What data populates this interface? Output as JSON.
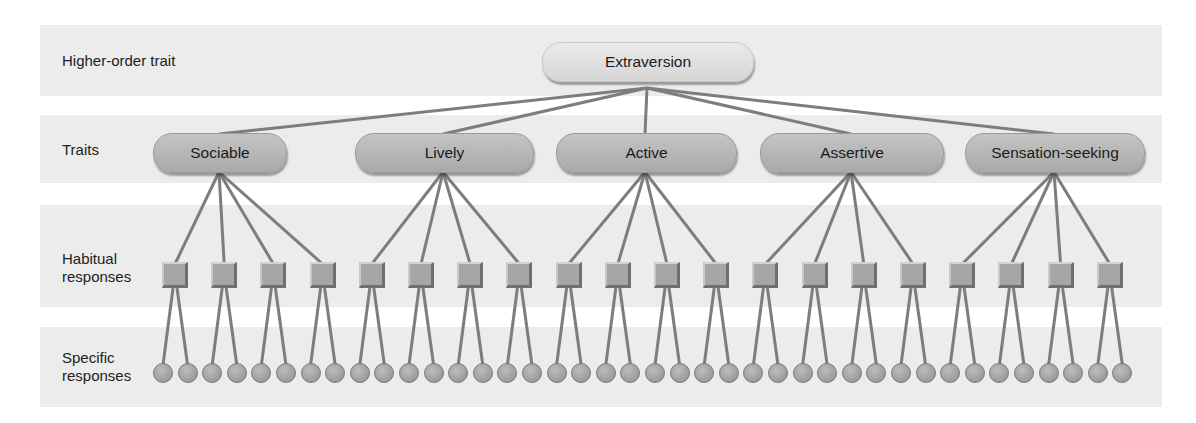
{
  "diagram": {
    "type": "hierarchy",
    "rows": [
      {
        "label": "Higher-order trait"
      },
      {
        "label": "Traits"
      },
      {
        "label": "Habitual responses"
      },
      {
        "label": "Specific responses"
      }
    ],
    "higher_order_trait": "Extraversion",
    "traits": [
      "Sociable",
      "Lively",
      "Active",
      "Assertive",
      "Sensation-seeking"
    ],
    "habitual_responses_per_trait": 4,
    "specific_responses_per_habitual": 2,
    "colors": {
      "band": "#ececec",
      "line": "#7d7d7d",
      "trait_fill": "#b5b5b5",
      "top_fill": "#e0e0e0",
      "node_fill": "#a6a6a6"
    }
  }
}
